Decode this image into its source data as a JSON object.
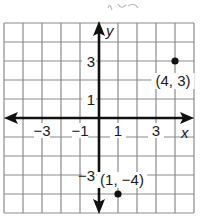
{
  "plane": {
    "x_range": [
      -5,
      5
    ],
    "y_range": [
      -5,
      5
    ],
    "grid_color": "#8a8a8a",
    "axis_color": "#111111",
    "x_axis_label": "x",
    "y_axis_label": "y",
    "x_tick_labels": [
      {
        "value": -3,
        "text": "−3"
      },
      {
        "value": -1,
        "text": "−1"
      },
      {
        "value": 1,
        "text": "1"
      },
      {
        "value": 3,
        "text": "3"
      }
    ],
    "y_tick_labels": [
      {
        "value": 3,
        "text": "3"
      },
      {
        "value": 1,
        "text": "1"
      },
      {
        "value": -3,
        "text": "−3"
      }
    ]
  },
  "points": [
    {
      "x": 4,
      "y": 3,
      "label": "(4, 3)"
    },
    {
      "x": 1,
      "y": -4,
      "label": "(1, −4)"
    }
  ],
  "scribble": "handwritten marks at top (partially cropped)"
}
